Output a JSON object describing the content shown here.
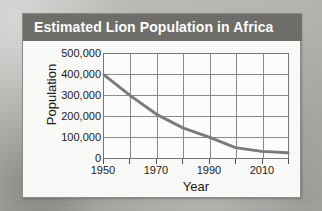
{
  "card": {
    "title": "Estimated Lion Population in Africa"
  },
  "chart_data": {
    "type": "line",
    "title": "Estimated Lion Population in Africa",
    "xlabel": "Year",
    "ylabel": "Population",
    "xlim": [
      1950,
      2020
    ],
    "ylim": [
      0,
      500000
    ],
    "grid": true,
    "legend": null,
    "x_major_ticks": [
      1950,
      1970,
      1990,
      2010
    ],
    "x_minor_ticks": [
      1960,
      1980,
      2000,
      2020
    ],
    "x_tick_labels": [
      "1950",
      "1970",
      "1990",
      "2010"
    ],
    "y_ticks": [
      0,
      100000,
      200000,
      300000,
      400000,
      500000
    ],
    "y_tick_labels": [
      "500,000",
      "400,000",
      "300,000",
      "200,000",
      "100,000",
      "0"
    ],
    "series": [
      {
        "name": "Lion population",
        "color": "#7b7a7e",
        "x": [
          1950,
          1960,
          1970,
          1980,
          1990,
          2000,
          2010,
          2020
        ],
        "values": [
          400000,
          300000,
          210000,
          145000,
          100000,
          50000,
          32000,
          25000
        ]
      }
    ]
  }
}
